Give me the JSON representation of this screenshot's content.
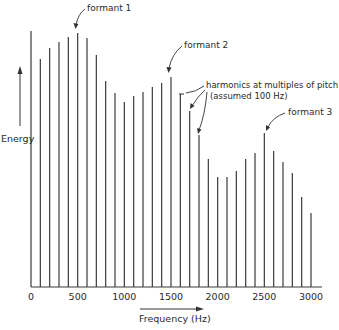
{
  "chart_data": {
    "type": "bar",
    "title": "",
    "xlabel": "Frequency (Hz)",
    "ylabel": "Energy",
    "xlim": [
      0,
      3000
    ],
    "x_ticks": [
      0,
      500,
      1000,
      1500,
      2000,
      2500,
      3000
    ],
    "x_tick_labels": [
      "0",
      "500",
      "1000",
      "1500",
      "2000",
      "2500",
      "3000"
    ],
    "grid": false,
    "legend": null,
    "y_units": "relative (pixel height above baseline, max ≈ 256)",
    "x": [
      0,
      100,
      200,
      300,
      400,
      500,
      600,
      700,
      800,
      900,
      1000,
      1100,
      1200,
      1300,
      1400,
      1500,
      1600,
      1700,
      1800,
      1900,
      2000,
      2100,
      2200,
      2300,
      2400,
      2500,
      2600,
      2700,
      2800,
      2900,
      3000
    ],
    "values": [
      256,
      228,
      239,
      245,
      250,
      254,
      249,
      232,
      206,
      194,
      185,
      191,
      195,
      200,
      204,
      210,
      193,
      176,
      152,
      128,
      110,
      110,
      116,
      128,
      134,
      154,
      136,
      125,
      114,
      90,
      74
    ],
    "annotations": [
      {
        "text": "formant 1",
        "x": 500
      },
      {
        "text": "formant 2",
        "x": 1500
      },
      {
        "text": "harmonics at multiples of pitch",
        "x": [
          1600,
          1700,
          1800
        ]
      },
      {
        "text": "(assumed 100 Hz)",
        "x": [
          1600,
          1700,
          1800
        ]
      },
      {
        "text": "formant 3",
        "x": 2500
      }
    ]
  },
  "labels": {
    "ylabel": "Energy",
    "xlabel": "Frequency (Hz)",
    "formant1": "formant 1",
    "formant2": "formant 2",
    "harmonics_line1": "harmonics at multiples of pitch",
    "harmonics_line2": "(assumed 100 Hz)",
    "formant3": "formant 3"
  }
}
